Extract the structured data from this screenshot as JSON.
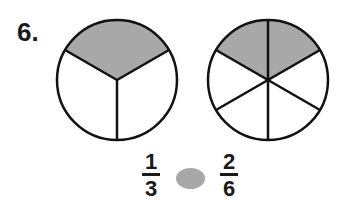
{
  "problem": {
    "number": "6.",
    "left_circle": {
      "parts": 3,
      "shaded": 1,
      "fill": "#a8a8a8"
    },
    "right_circle": {
      "parts": 6,
      "shaded": 2,
      "fill": "#a8a8a8"
    },
    "left_fraction": {
      "numerator": "1",
      "denominator": "3"
    },
    "right_fraction": {
      "numerator": "2",
      "denominator": "6"
    },
    "comparison_blank": {
      "color": "#a8a8a8"
    }
  }
}
